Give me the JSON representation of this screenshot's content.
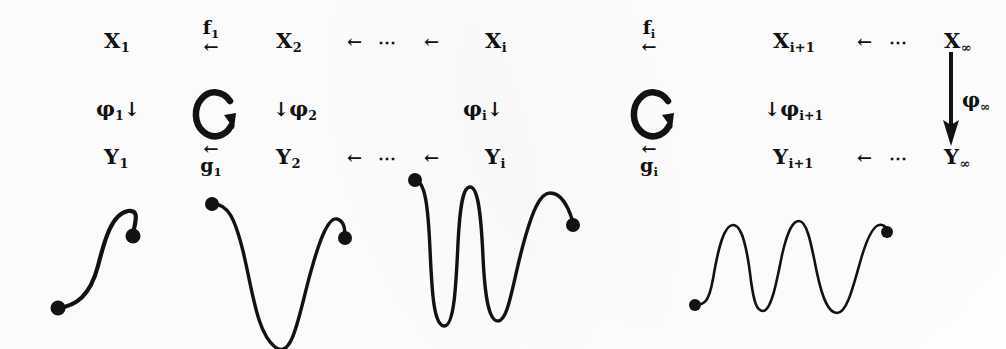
{
  "figure": {
    "kind": "commutative-diagram-with-curves",
    "background_color": "#ffffff",
    "ink_color": "#121212"
  },
  "diagram": {
    "top_row": {
      "objects": [
        "X₁",
        "X₂",
        "Xᵢ",
        "Xᵢ₊₁",
        "X∞"
      ],
      "object_parts": [
        {
          "base": "X",
          "sub": "1"
        },
        {
          "base": "X",
          "sub": "2"
        },
        {
          "base": "X",
          "sub": "i"
        },
        {
          "base": "X",
          "sub": "i+1"
        },
        {
          "base": "X",
          "sub": "∞"
        }
      ],
      "maps": [
        {
          "label_base": "f",
          "label_sub": "1",
          "arrow": "←",
          "position": "above"
        },
        {
          "label_base": "f",
          "label_sub": "i",
          "arrow": "←",
          "position": "above"
        }
      ],
      "ellipses": [
        "⋯",
        "⋯"
      ],
      "plain_arrows": [
        "←",
        "←",
        "←",
        "←",
        "←"
      ]
    },
    "vertical_maps": [
      {
        "label_base": "φ",
        "label_sub": "1",
        "arrow": "↓",
        "arrow_side": "right"
      },
      {
        "label_base": "φ",
        "label_sub": "2",
        "arrow": "↓",
        "arrow_side": "left"
      },
      {
        "label_base": "φ",
        "label_sub": "i",
        "arrow": "↓",
        "arrow_side": "right"
      },
      {
        "label_base": "φ",
        "label_sub": "i+1",
        "arrow": "↓",
        "arrow_side": "left"
      },
      {
        "label_base": "φ",
        "label_sub": "∞",
        "arrow": "long-down",
        "arrow_side": "left"
      }
    ],
    "commute_markers": [
      {
        "glyph": "↻",
        "name": "commutes-left"
      },
      {
        "glyph": "↻",
        "name": "commutes-right"
      }
    ],
    "bottom_row": {
      "objects": [
        "Y₁",
        "Y₂",
        "Yᵢ",
        "Yᵢ₊₁",
        "Y∞"
      ],
      "object_parts": [
        {
          "base": "Y",
          "sub": "1"
        },
        {
          "base": "Y",
          "sub": "2"
        },
        {
          "base": "Y",
          "sub": "i"
        },
        {
          "base": "Y",
          "sub": "i+1"
        },
        {
          "base": "Y",
          "sub": "∞"
        }
      ],
      "maps": [
        {
          "label_base": "g",
          "label_sub": "1",
          "arrow": "←",
          "position": "below"
        },
        {
          "label_base": "g",
          "label_sub": "i",
          "arrow": "←",
          "position": "below"
        }
      ],
      "ellipses": [
        "⋯",
        "⋯"
      ],
      "plain_arrows": [
        "←",
        "←",
        "←",
        "←",
        "←"
      ]
    }
  },
  "curves": [
    {
      "name": "curve-1",
      "description": "single S-bend rising left to right",
      "peaks": 1,
      "valleys": 0,
      "stroke_width": 4.2,
      "endpoints": [
        [
          28,
          128
        ],
        [
          103,
          56
        ]
      ],
      "path": "M 28 128 C 46 126 60 116 68 86 C 75 58 82 34 98 31 C 112 29 103 47 103 56",
      "dot_radius": [
        7.5,
        7.5
      ]
    },
    {
      "name": "curve-2",
      "description": "one deep valley with trailing peak",
      "peaks": 1,
      "valleys": 1,
      "stroke_width": 3.4,
      "endpoints": [
        [
          17,
          19
        ],
        [
          150,
          53
        ]
      ],
      "path": "M 17 19 C 33 18 40 34 48 66 C 58 108 62 148 80 162 C 98 176 104 128 116 86 C 126 50 134 32 142 34 C 150 36 150 46 150 53",
      "dot_radius": [
        7.0,
        7.0
      ]
    },
    {
      "name": "curve-3",
      "description": "two deep valleys, W-shaped",
      "peaks": 2,
      "valleys": 2,
      "stroke_width": 3.4,
      "endpoints": [
        [
          15,
          15
        ],
        [
          173,
          60
        ]
      ],
      "path": "M 15 15 C 25 16 28 40 30 84 C 32 130 34 160 44 161 C 54 162 56 122 58 78 C 60 40 63 22 70 22 C 78 22 81 48 83 92 C 85 134 89 156 98 156 C 108 156 112 122 122 84 C 132 46 140 28 150 28 C 162 28 168 42 172 54 C 173 58 173 59 173 60",
      "dot_radius": [
        7.0,
        7.0
      ]
    },
    {
      "name": "curve-4",
      "description": "three peaks, lighter stroke",
      "peaks": 3,
      "valleys": 2,
      "stroke_width": 2.6,
      "endpoints": [
        [
          18,
          120
        ],
        [
          210,
          47
        ]
      ],
      "path": "M 18 120 C 28 120 32 116 36 94 C 42 58 48 40 56 40 C 65 40 70 62 74 96 C 77 118 80 126 86 126 C 94 126 99 100 105 70 C 111 44 116 36 122 36 C 130 36 134 58 140 88 C 146 116 152 128 160 128 C 170 128 176 102 184 74 C 191 50 198 38 205 40 C 210 41 210 45 210 47",
      "dot_radius": [
        6.0,
        6.0
      ]
    }
  ]
}
